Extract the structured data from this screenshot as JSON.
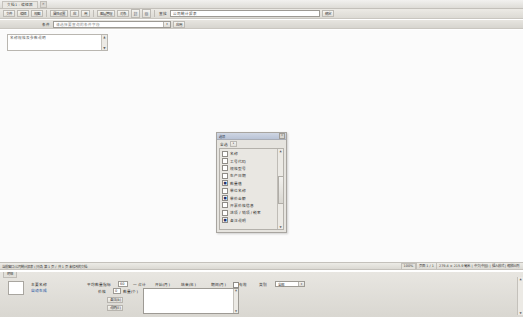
{
  "window": {
    "tab_label": "文档1 - 编辑器",
    "close_label": "✕"
  },
  "toolbar_primary": {
    "buttons": [
      {
        "name": "file-menu",
        "label": "文件"
      },
      {
        "name": "edit-menu",
        "label": "编辑"
      },
      {
        "name": "view-menu",
        "label": "视图"
      }
    ],
    "group2": [
      {
        "name": "properties-button",
        "label": "属性设置"
      },
      {
        "name": "apply-button",
        "label": "应"
      },
      {
        "name": "reset-button",
        "label": "用"
      }
    ],
    "group3": [
      {
        "name": "layer-button",
        "label": "图层管理"
      },
      {
        "name": "object-button",
        "label": "对象"
      }
    ],
    "icons": [
      {
        "name": "link-icon",
        "glyph": "⛓"
      },
      {
        "name": "image-icon",
        "glyph": "▨"
      }
    ],
    "search_label": "查找",
    "search_value": "公司统计报表",
    "search_placeholder": "输入关键字",
    "go_label": "确定"
  },
  "toolbar_secondary": {
    "label": "条件",
    "combo_value": "请选择要查询的条件字段",
    "combo_arrow": "▾",
    "apply_label": "应用"
  },
  "canvas": {
    "note_text": "名称规格及参数说明",
    "scroll_up": "▲",
    "scroll_down": "▼"
  },
  "dialog": {
    "title": "选项",
    "close_label": "✕",
    "header_label": "全选",
    "header_button": "▾",
    "scroll_up": "▲",
    "scroll_down": "▼",
    "items": [
      {
        "label": "名称",
        "checked": false
      },
      {
        "label": "工号代码",
        "checked": false
      },
      {
        "label": "规格型号",
        "checked": false
      },
      {
        "label": "生产日期",
        "checked": false
      },
      {
        "label": "数量值",
        "checked": true
      },
      {
        "label": "单位名称",
        "checked": false
      },
      {
        "label": "单价金额",
        "checked": true
      },
      {
        "label": "开票价格信息",
        "checked": false
      },
      {
        "label": "进项 / 销项 / 税率",
        "checked": false
      },
      {
        "label": "备注说明",
        "checked": true
      }
    ],
    "check_glyph": "■"
  },
  "statusbar": {
    "left_text": "当前窗口:公司统计报表 (只读) 第 1 页 / 共 1 页  未修改的文档",
    "zoom_label": "100%",
    "page_info": "页面 1 / 1",
    "doc_info": "279.4 × 215.9 毫米 | 中文(中国) | 插入模式 | 缩放比例"
  },
  "bottom_panel": {
    "tab_label": "明细",
    "fields": {
      "name_label": "主要名称",
      "name_value": "自动生成",
      "qty_label": "平均数量指标",
      "qty_value": "60",
      "price_label": "价格",
      "price_value": "0",
      "unit_label": "一 合计",
      "unit_label2": "数量(个)",
      "check1_label": "开始(月)",
      "check2_label": "结束(年)",
      "month_label": "期间(月)",
      "store_label": "备注(B)",
      "note_label": "说明(E)",
      "active_label": "有效",
      "select_label": "类别",
      "select_value": "全部",
      "select_arrow": "▾",
      "textarea_value": ""
    },
    "scroll_up": "▲",
    "scroll_down": "▼"
  },
  "colors": {
    "accent": "#1a4fa0",
    "dialog_title": "#b9c3d6",
    "chrome": "#e6e4df"
  }
}
